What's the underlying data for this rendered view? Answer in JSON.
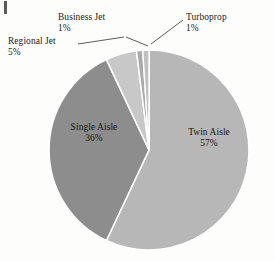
{
  "chart_data": {
    "type": "pie",
    "title": "",
    "subtitle": "",
    "xlabel": "",
    "ylabel": "",
    "legend_position": "none",
    "grid": false,
    "units": "percent",
    "total": 100,
    "categories": [
      "Twin Aisle",
      "Single Aisle",
      "Regional Jet",
      "Business Jet",
      "Turboprop"
    ],
    "values": [
      57,
      36,
      5,
      1,
      1
    ],
    "slices": [
      {
        "label": "Twin Aisle",
        "value": 57,
        "value_text": "57%",
        "color": "#b7b7b7",
        "label_placement": "inside"
      },
      {
        "label": "Single Aisle",
        "value": 36,
        "value_text": "36%",
        "color": "#8d8d8d",
        "label_placement": "inside"
      },
      {
        "label": "Regional Jet",
        "value": 5,
        "value_text": "5%",
        "color": "#c8c8c8",
        "label_placement": "outside-callout"
      },
      {
        "label": "Business Jet",
        "value": 1,
        "value_text": "1%",
        "color": "#aaaaaa",
        "label_placement": "outside-callout"
      },
      {
        "label": "Turboprop",
        "value": 1,
        "value_text": "1%",
        "color": "#c0c0c0",
        "label_placement": "outside-callout"
      }
    ]
  },
  "colors": {
    "background": "#fdfdfc",
    "slice_border": "#ffffff",
    "text": "#1b1b1b",
    "leader_line": "#4a4a4a",
    "twin_aisle": "#b7b7b7",
    "single_aisle": "#8d8d8d",
    "regional_jet": "#c8c8c8",
    "business_jet": "#aaaaaa",
    "turboprop": "#c0c0c0"
  },
  "labels": {
    "business_jet": {
      "name": "Business Jet",
      "pct": "1%"
    },
    "regional_jet": {
      "name": "Regional Jet",
      "pct": "5%"
    },
    "turboprop": {
      "name": "Turboprop",
      "pct": "1%"
    },
    "single_aisle": {
      "name": "Single Aisle",
      "pct": "36%"
    },
    "twin_aisle": {
      "name": "Twin Aisle",
      "pct": "57%"
    }
  }
}
